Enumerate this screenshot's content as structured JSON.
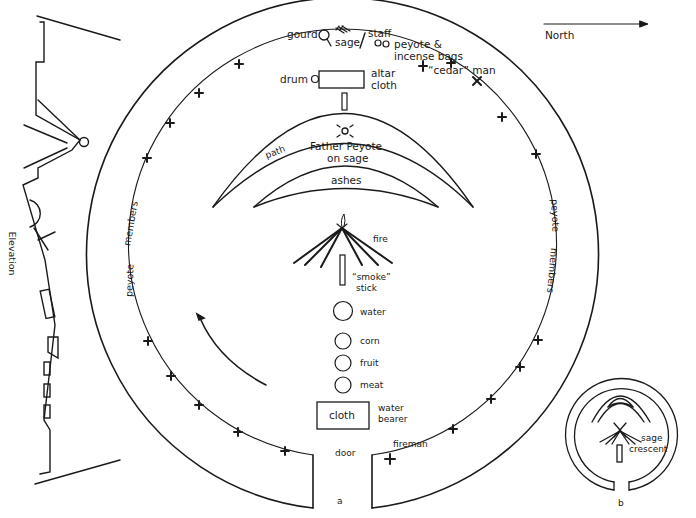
{
  "compass": {
    "label": "North",
    "direction": "right"
  },
  "elevation": {
    "label": "Elevation"
  },
  "figure_a": {
    "caption": "a",
    "top_items": {
      "gourd": "gourd",
      "sage": "sage",
      "staff": "staff",
      "peyote_bags_line1": "peyote &",
      "peyote_bags_line2": "incense bags",
      "cedar_man": "“cedar” man"
    },
    "altar": {
      "drum": "drum",
      "altar_cloth_line1": "altar",
      "altar_cloth_line2": "cloth"
    },
    "crescent": {
      "path": "path",
      "father_peyote_line1": "Father Peyote",
      "father_peyote_line2": "on sage",
      "ashes": "ashes"
    },
    "center": {
      "fire": "fire",
      "smoke_stick_line1": "“smoke”",
      "smoke_stick_line2": "stick",
      "water": "water",
      "corn": "corn",
      "fruit": "fruit",
      "meat": "meat",
      "cloth": "cloth",
      "water_bearer_line1": "water",
      "water_bearer_line2": "bearer"
    },
    "ring": {
      "left_peyote": "peyote",
      "left_members": "members",
      "right_peyote": "peyote",
      "right_members": "members",
      "door": "door",
      "fireman": "fireman"
    }
  },
  "figure_b": {
    "caption": "b",
    "sage_crescent_line1": "sage",
    "sage_crescent_line2": "crescent"
  }
}
